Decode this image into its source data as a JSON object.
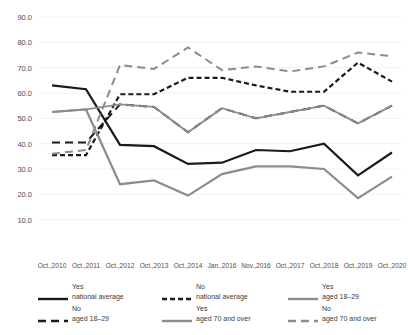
{
  "partial_title": "",
  "chart_data": {
    "type": "line",
    "title": "",
    "xlabel": "",
    "ylabel": "",
    "ylim": [
      0,
      90
    ],
    "yticks": [
      "10.0",
      "20.0",
      "30.0",
      "40.0",
      "50.0",
      "60.0",
      "70.0",
      "80.0",
      "90.0"
    ],
    "ytick_values": [
      10,
      20,
      30,
      40,
      50,
      60,
      70,
      80,
      90
    ],
    "grid": true,
    "legend_position": "bottom",
    "categories": [
      "Oct.,2010",
      "Oct.,2011",
      "Oct.,2012",
      "Oct.,2013",
      "Oct.,2014",
      "Jan.,2016",
      "Nov.,2016",
      "Oct.,2017",
      "Oct.,2018",
      "Oct.,2019",
      "Oct.,2020"
    ],
    "series": [
      {
        "name": "Yes national average",
        "label_line1": "Yes",
        "label_line2": "national average",
        "color": "#1a1a1a",
        "style": "solid",
        "width": 2.2,
        "values": [
          63.0,
          61.5,
          39.5,
          39.0,
          32.0,
          32.5,
          37.5,
          37.0,
          40.0,
          27.5,
          36.5
        ]
      },
      {
        "name": "No national average",
        "label_line1": "No",
        "label_line2": "national average",
        "color": "#1a1a1a",
        "style": "dashed",
        "width": 2.2,
        "values": [
          35.5,
          35.5,
          59.5,
          59.5,
          66.0,
          66.0,
          63.0,
          60.5,
          60.5,
          72.0,
          64.5
        ]
      },
      {
        "name": "Yes aged 18-29",
        "label_line1": "Yes",
        "label_line2": "aged 18–29",
        "color": "#8c8c8c",
        "style": "solid",
        "width": 2.2,
        "values": [
          52.5,
          53.5,
          24.0,
          25.5,
          19.5,
          28.0,
          31.0,
          31.0,
          30.0,
          18.5,
          27.0
        ]
      },
      {
        "name": "No aged 18-29",
        "label_line1": "No",
        "label_line2": "aged 18–29",
        "color": "#1a1a1a",
        "style": "dashed-long",
        "width": 2.0,
        "values": [
          40.5,
          40.5,
          55.5,
          54.5,
          44.5,
          54.0,
          50.0,
          52.5,
          55.0,
          48.0,
          55.0
        ]
      },
      {
        "name": "Yes aged 70 and over",
        "label_line1": "Yes",
        "label_line2": "aged 70 and over",
        "color": "#8c8c8c",
        "style": "solid",
        "width": 1.8,
        "values": [
          52.5,
          53.5,
          55.5,
          54.5,
          44.5,
          54.0,
          50.0,
          52.5,
          55.0,
          48.0,
          55.0
        ]
      },
      {
        "name": "No aged 70 and over",
        "label_line1": "No",
        "label_line2": "aged 70 and over",
        "color": "#8c8c8c",
        "style": "dashed-long",
        "width": 2.0,
        "values": [
          36.0,
          37.5,
          71.0,
          69.5,
          78.0,
          69.0,
          70.5,
          68.5,
          70.5,
          76.0,
          74.5
        ]
      }
    ]
  },
  "legend": {
    "columns": [
      [
        {
          "line1": "Yes",
          "line2": "national average",
          "color": "#1a1a1a",
          "style": "solid"
        },
        {
          "line1": "No",
          "line2": "aged 18–29",
          "color": "#1a1a1a",
          "style": "dashed-long"
        }
      ],
      [
        {
          "line1": "No",
          "line2": "national average",
          "color": "#1a1a1a",
          "style": "dashed"
        },
        {
          "line1": "Yes",
          "line2": "aged 70 and over",
          "color": "#8c8c8c",
          "style": "solid"
        }
      ],
      [
        {
          "line1": "Yes",
          "line2": "aged 18–29",
          "color": "#8c8c8c",
          "style": "solid"
        },
        {
          "line1": "No",
          "line2": "aged 70 and over",
          "color": "#8c8c8c",
          "style": "dashed-long"
        }
      ]
    ]
  }
}
